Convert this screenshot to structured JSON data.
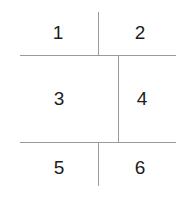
{
  "diagram": {
    "type": "partitioned-grid",
    "colors": {
      "background": "#ffffff",
      "line": "#9a9a9a",
      "label_text": "#1c1c1c"
    },
    "cells": [
      {
        "id": "cell-1",
        "label": "1",
        "row": 1,
        "column": "left"
      },
      {
        "id": "cell-2",
        "label": "2",
        "row": 1,
        "column": "right"
      },
      {
        "id": "cell-3",
        "label": "3",
        "row": 2,
        "column": "left"
      },
      {
        "id": "cell-4",
        "label": "4",
        "row": 2,
        "column": "right"
      },
      {
        "id": "cell-5",
        "label": "5",
        "row": 3,
        "column": "left"
      },
      {
        "id": "cell-6",
        "label": "6",
        "row": 3,
        "column": "right"
      }
    ],
    "dividers": {
      "horizontal": [
        {
          "id": "rule-top",
          "y": 55,
          "x_start": 20,
          "x_end": 176
        },
        {
          "id": "rule-bottom",
          "y": 142,
          "x_start": 20,
          "x_end": 176
        }
      ],
      "vertical": [
        {
          "id": "rule-v-top",
          "x": 98,
          "y_start": 12,
          "y_end": 56
        },
        {
          "id": "rule-v-middle",
          "x": 118,
          "y_start": 55,
          "y_end": 143
        },
        {
          "id": "rule-v-bottom",
          "x": 98,
          "y_start": 142,
          "y_end": 186
        }
      ]
    }
  }
}
